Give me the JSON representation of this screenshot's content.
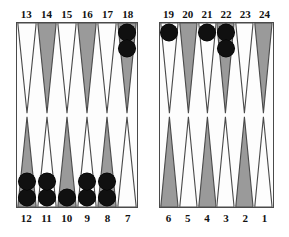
{
  "board": {
    "title": "Backgammon board",
    "colors": {
      "point_dark": "#9a9a9a",
      "point_light": "#fdfdfd",
      "checker_black": "#101010",
      "border": "#4a4a4a",
      "background": "#ffffff",
      "label_text": "#111111"
    },
    "quadrants": {
      "top_left": {
        "labels": [
          "13",
          "14",
          "15",
          "16",
          "17",
          "18"
        ],
        "points": [
          {
            "label": "13",
            "shade": "light",
            "checkers": 0,
            "checker_color": "black"
          },
          {
            "label": "14",
            "shade": "dark",
            "checkers": 0,
            "checker_color": "black"
          },
          {
            "label": "15",
            "shade": "light",
            "checkers": 0,
            "checker_color": "black"
          },
          {
            "label": "16",
            "shade": "dark",
            "checkers": 0,
            "checker_color": "black"
          },
          {
            "label": "17",
            "shade": "light",
            "checkers": 0,
            "checker_color": "black"
          },
          {
            "label": "18",
            "shade": "dark",
            "checkers": 2,
            "checker_color": "black"
          }
        ]
      },
      "top_right": {
        "labels": [
          "19",
          "20",
          "21",
          "22",
          "23",
          "24"
        ],
        "points": [
          {
            "label": "19",
            "shade": "light",
            "checkers": 1,
            "checker_color": "black"
          },
          {
            "label": "20",
            "shade": "dark",
            "checkers": 0,
            "checker_color": "black"
          },
          {
            "label": "21",
            "shade": "light",
            "checkers": 1,
            "checker_color": "black"
          },
          {
            "label": "22",
            "shade": "dark",
            "checkers": 2,
            "checker_color": "black"
          },
          {
            "label": "23",
            "shade": "light",
            "checkers": 0,
            "checker_color": "black"
          },
          {
            "label": "24",
            "shade": "dark",
            "checkers": 0,
            "checker_color": "black"
          }
        ]
      },
      "bottom_left": {
        "labels": [
          "12",
          "11",
          "10",
          "9",
          "8",
          "7"
        ],
        "points": [
          {
            "label": "12",
            "shade": "dark",
            "checkers": 2,
            "checker_color": "black"
          },
          {
            "label": "11",
            "shade": "light",
            "checkers": 2,
            "checker_color": "black"
          },
          {
            "label": "10",
            "shade": "dark",
            "checkers": 1,
            "checker_color": "black"
          },
          {
            "label": "9",
            "shade": "light",
            "checkers": 2,
            "checker_color": "black"
          },
          {
            "label": "8",
            "shade": "dark",
            "checkers": 2,
            "checker_color": "black"
          },
          {
            "label": "7",
            "shade": "light",
            "checkers": 0,
            "checker_color": "black"
          }
        ]
      },
      "bottom_right": {
        "labels": [
          "6",
          "5",
          "4",
          "3",
          "2",
          "1"
        ],
        "points": [
          {
            "label": "6",
            "shade": "dark",
            "checkers": 0,
            "checker_color": "black"
          },
          {
            "label": "5",
            "shade": "light",
            "checkers": 0,
            "checker_color": "black"
          },
          {
            "label": "4",
            "shade": "dark",
            "checkers": 0,
            "checker_color": "black"
          },
          {
            "label": "3",
            "shade": "light",
            "checkers": 0,
            "checker_color": "black"
          },
          {
            "label": "2",
            "shade": "dark",
            "checkers": 0,
            "checker_color": "black"
          },
          {
            "label": "1",
            "shade": "light",
            "checkers": 0,
            "checker_color": "black"
          }
        ]
      }
    }
  }
}
